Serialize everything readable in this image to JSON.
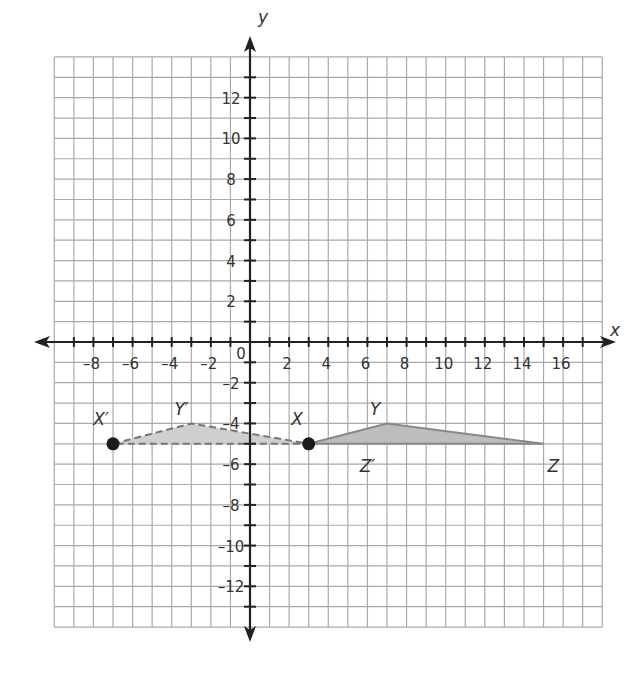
{
  "chart_data": {
    "type": "coordinate-plane",
    "title": "",
    "xlabel": "x",
    "ylabel": "y",
    "xlim": [
      -10,
      18
    ],
    "ylim": [
      -14,
      14
    ],
    "grid": true,
    "x_ticks": [
      "-8",
      "-6",
      "-4",
      "-2",
      "2",
      "4",
      "6",
      "8",
      "10",
      "12",
      "14",
      "16"
    ],
    "y_ticks": [
      "12",
      "10",
      "8",
      "6",
      "4",
      "2",
      "-2",
      "-4",
      "-6",
      "-8",
      "-10",
      "-12"
    ],
    "origin_label": "0",
    "shapes": [
      {
        "name": "triangle XYZ",
        "style": "solid",
        "fill": "#bdbdbd",
        "vertices": [
          {
            "label": "X",
            "x": 3,
            "y": -5
          },
          {
            "label": "Y",
            "x": 7,
            "y": -4
          },
          {
            "label": "Z",
            "x": 15,
            "y": -5
          }
        ]
      },
      {
        "name": "triangle X'Y'Z'",
        "style": "dashed",
        "fill": "#cfcfcf",
        "vertices": [
          {
            "label": "X'",
            "x": -7,
            "y": -5
          },
          {
            "label": "Y'",
            "x": -3,
            "y": -4
          },
          {
            "label": "Z'",
            "x": 3,
            "y": -5
          }
        ]
      }
    ],
    "points": [
      {
        "label": "X'",
        "x": -7,
        "y": -5
      },
      {
        "label": "X",
        "x": 3,
        "y": -5
      }
    ]
  },
  "labels": {
    "x_axis": "x",
    "y_axis": "y",
    "origin": "0",
    "X": "X",
    "Y": "Y",
    "Z": "Z",
    "Xp": "X′",
    "Yp": "Y′",
    "Zp": "Z′"
  }
}
